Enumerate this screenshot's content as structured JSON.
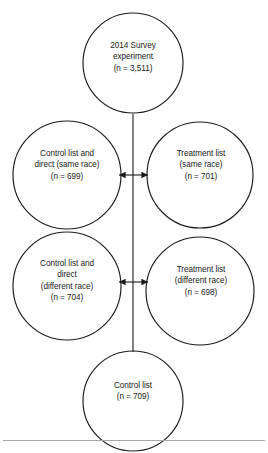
{
  "figure": {
    "type": "flow-diagram",
    "background_color": "#ffffff",
    "stroke_color": "#1b1b1b",
    "text_color": "#1b1b1b",
    "rule_color": "#a8a8a8"
  },
  "nodes": {
    "top": {
      "name": "survey-experiment",
      "lines": [
        "2014 Survey",
        "experiment",
        "(n = 3,511)"
      ],
      "line1": "2014 Survey",
      "line2": "experiment",
      "line3": "(n = 3,511)",
      "n": 3511
    },
    "control_same": {
      "name": "control-list-direct-same-race",
      "lines": [
        "Control list and",
        "direct (same race)",
        "(n = 699)"
      ],
      "line1": "Control list and",
      "line2": "direct (same race)",
      "line3": "(n = 699)",
      "n": 699
    },
    "treatment_same": {
      "name": "treatment-list-same-race",
      "lines": [
        "Treatment list",
        "(same race)",
        "(n = 701)"
      ],
      "line1": "Treatment list",
      "line2": "(same race)",
      "line3": "(n = 701)",
      "n": 701
    },
    "control_different": {
      "name": "control-list-direct-different-race",
      "lines": [
        "Control list and",
        "direct",
        "(different race)",
        "(n = 704)"
      ],
      "line1": "Control list and",
      "line2": "direct",
      "line3": "(different race)",
      "line4": "(n = 704)",
      "n": 704
    },
    "treatment_different": {
      "name": "treatment-list-different-race",
      "lines": [
        "Treatment list",
        "(different race)",
        "(n = 698)"
      ],
      "line1": "Treatment list",
      "line2": "(different race)",
      "line3": "(n = 698)",
      "n": 698
    },
    "bottom": {
      "name": "control-list",
      "lines": [
        "Control list",
        "(n = 709)"
      ],
      "line1": "Control list",
      "line2": "(n = 709)",
      "n": 709
    }
  },
  "connectors": {
    "spine": "vertical line from survey experiment circle down to control list circle",
    "arrow_same_race": "double-headed arrow between control list and direct (same race) and treatment list (same race)",
    "arrow_different_race": "double-headed arrow between control list and direct (different race) and treatment list (different race)"
  }
}
